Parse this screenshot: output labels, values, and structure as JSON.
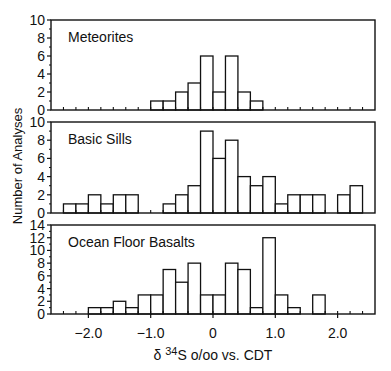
{
  "chart_data": [
    {
      "type": "bar",
      "title": "Meteorites",
      "xlabel": "δ 34S o/oo vs. CDT",
      "ylabel": "Number of Analyses",
      "bin_width": 0.2,
      "bin_start": -1.0,
      "values": [
        1,
        1,
        2,
        3,
        6,
        2,
        6,
        2,
        1
      ],
      "ylim": [
        0,
        10
      ],
      "yticks": [
        0,
        2,
        4,
        6,
        8,
        10
      ]
    },
    {
      "type": "bar",
      "title": "Basic Sills",
      "xlabel": "δ 34S o/oo vs. CDT",
      "ylabel": "Number of Analyses",
      "bin_width": 0.2,
      "bin_start": -2.4,
      "values": [
        1,
        1,
        2,
        1,
        2,
        2,
        0,
        0,
        1,
        2,
        3,
        9,
        6,
        8,
        4,
        3,
        4,
        1,
        2,
        2,
        2,
        0,
        2,
        3
      ],
      "ylim": [
        0,
        10
      ],
      "yticks": [
        0,
        2,
        4,
        6,
        8,
        10
      ]
    },
    {
      "type": "bar",
      "title": "Ocean Floor Basalts",
      "xlabel": "δ 34S o/oo vs. CDT",
      "ylabel": "Number of Analyses",
      "bin_width": 0.2,
      "bin_start": -2.0,
      "values": [
        1,
        1,
        2,
        1,
        3,
        3,
        7,
        5,
        8,
        3,
        3,
        8,
        7,
        1,
        12,
        3,
        1,
        0,
        3
      ],
      "ylim": [
        0,
        14
      ],
      "yticks": [
        0,
        2,
        4,
        6,
        8,
        10,
        12,
        14
      ]
    }
  ],
  "axes": {
    "xlim": [
      -2.6,
      2.6
    ],
    "xticks": [
      -2.0,
      -1.0,
      0,
      1.0,
      2.0
    ],
    "xtick_labels": [
      "−2.0",
      "−1.0",
      "0",
      "1.0",
      "2.0"
    ],
    "xlabel_prefix": "δ ",
    "xlabel_sup": "34",
    "xlabel_rest": "S o/oo vs. CDT",
    "ylabel": "Number of Analyses"
  }
}
